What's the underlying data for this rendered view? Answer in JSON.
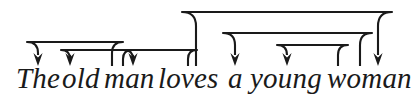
{
  "figure": {
    "type": "dependency-arrow-diagram",
    "width": 415,
    "height": 99,
    "background_color": "#ffffff",
    "stroke_color": "#1a1a1a",
    "text_color": "#1a1a1a",
    "sentence": "The old man loves a young woman"
  },
  "words": [
    {
      "id": "the",
      "text": "The",
      "x": 16,
      "index": 0
    },
    {
      "id": "old",
      "text": "old",
      "x": 62,
      "index": 1
    },
    {
      "id": "man",
      "text": "man",
      "x": 104,
      "index": 2
    },
    {
      "id": "loves",
      "text": "loves",
      "x": 158,
      "index": 3
    },
    {
      "id": "a",
      "text": "a",
      "x": 228,
      "index": 4
    },
    {
      "id": "young",
      "text": "young",
      "x": 250,
      "index": 5
    },
    {
      "id": "woman",
      "text": "woman",
      "x": 327,
      "index": 6
    }
  ],
  "arcs": [
    {
      "id": "arc-man-to-the",
      "source_word": "man",
      "target_word": "The",
      "source_x": 112,
      "target_x": 38,
      "top_y": 42,
      "bottom_y": 66,
      "corner_radius": 11,
      "direction": "leftward"
    },
    {
      "id": "arc-man-to-old",
      "source_word": "man",
      "target_word": "old",
      "source_x": 123,
      "target_x": 70,
      "top_y": 50,
      "bottom_y": 66,
      "corner_radius": 9,
      "direction": "leftward"
    },
    {
      "id": "arc-loves-to-man",
      "source_word": "loves",
      "target_word": "man",
      "source_x": 188,
      "target_x": 133,
      "top_y": 50,
      "bottom_y": 66,
      "corner_radius": 9,
      "direction": "leftward"
    },
    {
      "id": "arc-loves-to-woman",
      "source_word": "loves",
      "target_word": "woman",
      "source_x": 196,
      "target_x": 378,
      "top_y": 12,
      "bottom_y": 66,
      "corner_radius": 14,
      "direction": "rightward"
    },
    {
      "id": "arc-woman-to-a",
      "source_word": "woman",
      "target_word": "a",
      "source_x": 360,
      "target_x": 235,
      "top_y": 33,
      "bottom_y": 66,
      "corner_radius": 12,
      "direction": "leftward"
    },
    {
      "id": "arc-woman-to-young",
      "source_word": "woman",
      "target_word": "young",
      "source_x": 338,
      "target_x": 287,
      "top_y": 45,
      "bottom_y": 66,
      "corner_radius": 10,
      "direction": "leftward"
    }
  ]
}
